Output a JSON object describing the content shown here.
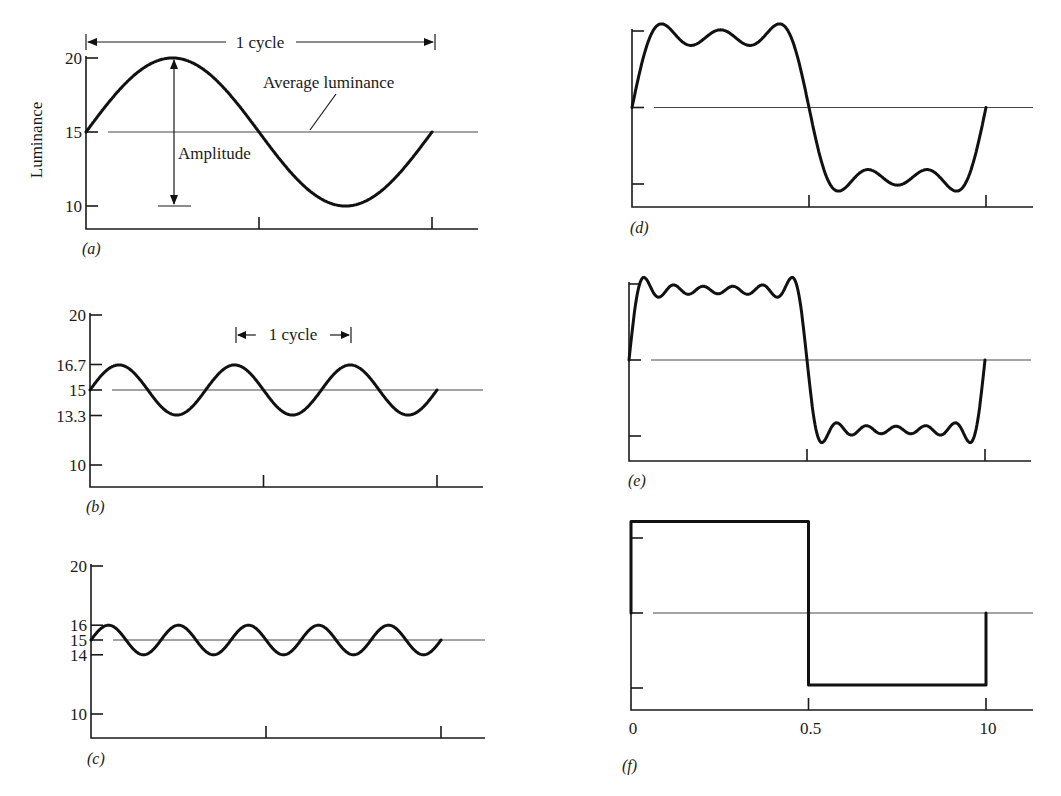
{
  "figure": {
    "background": "#ffffff",
    "ink": "#111111"
  },
  "chart_data": [
    {
      "id": "a",
      "type": "line",
      "panel_label": "(a)",
      "title": "",
      "ylabel": "Luminance",
      "xlabel": "",
      "y_ticks": [
        {
          "value": 20,
          "label": "20"
        },
        {
          "value": 15,
          "label": "15"
        },
        {
          "value": 10,
          "label": "10"
        }
      ],
      "x_ticks": [
        {
          "value": 0.5,
          "label": ""
        },
        {
          "value": 1.0,
          "label": ""
        }
      ],
      "ylim": [
        8.5,
        20
      ],
      "xlim": [
        0,
        1.25
      ],
      "average_luminance": 15,
      "waveform": {
        "kind": "sine",
        "mean": 15,
        "amplitude": 5,
        "cycles": 1,
        "x_end": 1.0
      },
      "annotations": {
        "cycle_label": "1 cycle",
        "average_label": "Average luminance",
        "amplitude_label": "Amplitude"
      },
      "grid": false,
      "legend": null
    },
    {
      "id": "b",
      "type": "line",
      "panel_label": "(b)",
      "ylabel": "",
      "xlabel": "",
      "y_ticks": [
        {
          "value": 20,
          "label": "20"
        },
        {
          "value": 16.7,
          "label": "16.7"
        },
        {
          "value": 15,
          "label": "15"
        },
        {
          "value": 13.3,
          "label": "13.3"
        },
        {
          "value": 10,
          "label": "10"
        }
      ],
      "x_ticks": [
        {
          "value": 0.5,
          "label": ""
        },
        {
          "value": 1.0,
          "label": ""
        }
      ],
      "ylim": [
        8.5,
        20
      ],
      "xlim": [
        0,
        1.25
      ],
      "average_luminance": 15,
      "waveform": {
        "kind": "sine",
        "mean": 15,
        "amplitude": 1.67,
        "cycles": 3,
        "x_end": 1.0
      },
      "annotations": {
        "cycle_label": "1 cycle"
      },
      "grid": false,
      "legend": null
    },
    {
      "id": "c",
      "type": "line",
      "panel_label": "(c)",
      "ylabel": "",
      "xlabel": "",
      "y_ticks": [
        {
          "value": 20,
          "label": "20"
        },
        {
          "value": 16,
          "label": "16"
        },
        {
          "value": 15,
          "label": "15"
        },
        {
          "value": 14,
          "label": "14"
        },
        {
          "value": 10,
          "label": "10"
        }
      ],
      "x_ticks": [
        {
          "value": 0.5,
          "label": ""
        },
        {
          "value": 1.0,
          "label": ""
        }
      ],
      "ylim": [
        8.5,
        20
      ],
      "xlim": [
        0,
        1.25
      ],
      "average_luminance": 15,
      "waveform": {
        "kind": "sine",
        "mean": 15,
        "amplitude": 1,
        "cycles": 5,
        "x_end": 1.0
      },
      "grid": false,
      "legend": null
    },
    {
      "id": "d",
      "type": "line",
      "panel_label": "(d)",
      "ylabel": "",
      "xlabel": "",
      "y_ticks": [
        {
          "value": 20,
          "label": ""
        },
        {
          "value": 15,
          "label": ""
        },
        {
          "value": 10,
          "label": ""
        }
      ],
      "x_ticks": [
        {
          "value": 0.5,
          "label": ""
        },
        {
          "value": 1.0,
          "label": ""
        }
      ],
      "ylim": [
        8.5,
        20
      ],
      "xlim": [
        0,
        1.13
      ],
      "average_luminance": 15,
      "waveform": {
        "kind": "fourier_square",
        "mean": 15,
        "amplitude": 5,
        "harmonics": [
          1,
          3,
          5
        ],
        "x_end": 1.0
      },
      "grid": false,
      "legend": null
    },
    {
      "id": "e",
      "type": "line",
      "panel_label": "(e)",
      "ylabel": "",
      "xlabel": "",
      "y_ticks": [
        {
          "value": 20,
          "label": ""
        },
        {
          "value": 15,
          "label": ""
        },
        {
          "value": 10,
          "label": ""
        }
      ],
      "x_ticks": [
        {
          "value": 0.5,
          "label": ""
        },
        {
          "value": 1.0,
          "label": ""
        }
      ],
      "ylim": [
        8.5,
        20
      ],
      "xlim": [
        0,
        1.13
      ],
      "average_luminance": 15,
      "waveform": {
        "kind": "fourier_square",
        "mean": 15,
        "amplitude": 5,
        "harmonics": [
          1,
          3,
          5,
          7,
          9,
          11
        ],
        "x_end": 1.0
      },
      "grid": false,
      "legend": null
    },
    {
      "id": "f",
      "type": "line",
      "panel_label": "(f)",
      "ylabel": "",
      "xlabel": "",
      "y_ticks": [
        {
          "value": 20,
          "label": ""
        },
        {
          "value": 15,
          "label": ""
        },
        {
          "value": 10,
          "label": ""
        }
      ],
      "x_ticks": [
        {
          "value": 0,
          "label": "0"
        },
        {
          "value": 0.5,
          "label": "0.5"
        },
        {
          "value": 1.0,
          "label": "10"
        }
      ],
      "ylim": [
        8.5,
        20
      ],
      "xlim": [
        0,
        1.13
      ],
      "average_luminance": 15,
      "waveform": {
        "kind": "square",
        "mean": 15,
        "amplitude": 5,
        "x_end": 1.0
      },
      "grid": false,
      "legend": null
    }
  ]
}
